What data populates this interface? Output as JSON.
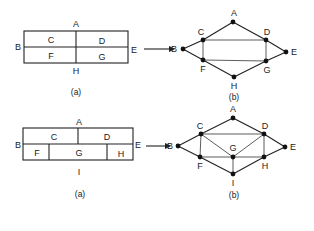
{
  "figure_top": {
    "floorplan": {
      "caption": "(a)",
      "outside_labels": {
        "top": "A",
        "left": "B",
        "right": "E",
        "bottom": "H"
      },
      "rooms": [
        "C",
        "D",
        "F",
        "G"
      ]
    },
    "graph": {
      "caption": "(b)",
      "nodes": [
        "A",
        "B",
        "C",
        "D",
        "E",
        "F",
        "G",
        "H"
      ],
      "edges": [
        [
          "A",
          "C"
        ],
        [
          "A",
          "D"
        ],
        [
          "B",
          "C"
        ],
        [
          "B",
          "F"
        ],
        [
          "C",
          "D"
        ],
        [
          "C",
          "F"
        ],
        [
          "D",
          "E"
        ],
        [
          "D",
          "G"
        ],
        [
          "E",
          "G"
        ],
        [
          "F",
          "G"
        ],
        [
          "F",
          "H"
        ],
        [
          "G",
          "H"
        ]
      ]
    }
  },
  "figure_bottom": {
    "floorplan": {
      "caption": "(a)",
      "outside_labels": {
        "top": "A",
        "left": "B",
        "right": "E",
        "bottom": "I"
      },
      "rooms": [
        "C",
        "D",
        "F",
        "G",
        "H"
      ]
    },
    "graph": {
      "caption": "(b)",
      "nodes": [
        "A",
        "B",
        "C",
        "D",
        "E",
        "F",
        "G",
        "H",
        "I"
      ],
      "edges": [
        [
          "A",
          "C"
        ],
        [
          "A",
          "D"
        ],
        [
          "B",
          "C"
        ],
        [
          "B",
          "F"
        ],
        [
          "C",
          "D"
        ],
        [
          "C",
          "F"
        ],
        [
          "C",
          "G"
        ],
        [
          "D",
          "G"
        ],
        [
          "D",
          "H"
        ],
        [
          "D",
          "E"
        ],
        [
          "E",
          "H"
        ],
        [
          "F",
          "G"
        ],
        [
          "G",
          "H"
        ],
        [
          "F",
          "I"
        ],
        [
          "G",
          "I"
        ],
        [
          "H",
          "I"
        ]
      ]
    }
  }
}
